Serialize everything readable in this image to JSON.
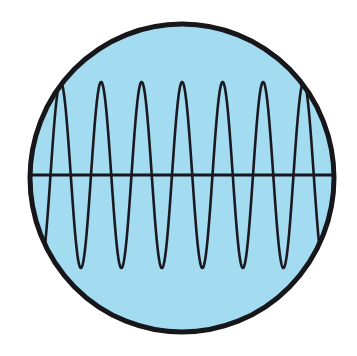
{
  "figure": {
    "name": "oscilloscope-waveform-in-circle",
    "kind": "diagram",
    "canvas": {
      "width": 357,
      "height": 356,
      "background": "#ffffff"
    }
  },
  "colors": {
    "screen_fill": "#a3dcf0",
    "outline": "#17161a",
    "axis": "#17161a",
    "trace": "#1a1820",
    "background": "#ffffff"
  },
  "screen": {
    "label": "circular screen face",
    "center_x": 182,
    "center_y": 178,
    "radius_x": 152,
    "radius_y": 154,
    "stroke_width": 5,
    "fill": "#a3dcf0"
  },
  "axis": {
    "label": "horizontal baseline axis",
    "y": 175,
    "x_start": 30,
    "x_end": 334,
    "stroke_width": 3,
    "color": "#17161a"
  },
  "chart_data": {
    "type": "line",
    "title": "",
    "subtitle": "",
    "xlabel": "",
    "ylabel": "",
    "legend": [],
    "grid": false,
    "waveform": "sine",
    "amplitude_px": 93,
    "baseline_y": 175,
    "peak_y": 82,
    "trough_y": 268,
    "cycles_visible": 7.6,
    "wavelength_px": 40.5,
    "phase_offset_px": 14,
    "x_start": 30,
    "x_end": 334,
    "stroke_width": 2.6,
    "stroke_color": "#1a1820",
    "xlim": [
      30,
      334
    ],
    "ylim": [
      82,
      268
    ],
    "peak_x_positions": [
      62,
      103,
      144,
      184,
      225,
      265,
      306
    ],
    "trough_x_positions": [
      42,
      83,
      124,
      164,
      205,
      245,
      286,
      326
    ],
    "zero_crossings_x": [
      32,
      52,
      73,
      93,
      114,
      134,
      154,
      175,
      195,
      215,
      236,
      256,
      276,
      297,
      317,
      334
    ]
  }
}
